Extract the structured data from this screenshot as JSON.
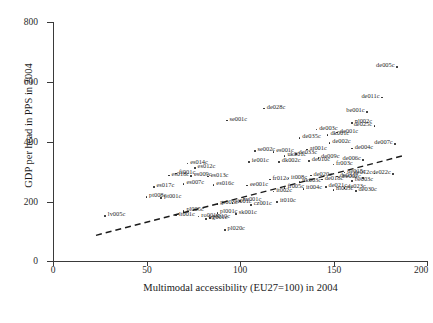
{
  "chart_data": {
    "type": "scatter",
    "title": "",
    "xlabel": "Multimodal accessibility (EU27=100) in 2004",
    "ylabel": "GDP per head in PPS in 2004",
    "xlim": [
      0,
      200
    ],
    "ylim": [
      0,
      800
    ],
    "xticks": [
      0,
      50,
      100,
      150,
      200
    ],
    "yticks": [
      0,
      200,
      400,
      600,
      800
    ],
    "grid": false,
    "legend": "none",
    "marker": "small-dot",
    "trendline": {
      "type": "linear-dashed",
      "x_start": 23,
      "y_start": 86,
      "x_end": 187,
      "y_end": 352
    },
    "points": [
      {
        "label": "de005c",
        "x": 184,
        "y": 648
      },
      {
        "label": "de011c",
        "x": 176,
        "y": 546
      },
      {
        "label": "be001c",
        "x": 168,
        "y": 498
      },
      {
        "label": "de028c",
        "x": 113,
        "y": 510
      },
      {
        "label": "nl002c",
        "x": 160,
        "y": 462
      },
      {
        "label": "de025c",
        "x": 172,
        "y": 452
      },
      {
        "label": "se001c",
        "x": 93,
        "y": 470
      },
      {
        "label": "de003c",
        "x": 141,
        "y": 440
      },
      {
        "label": "dk001c",
        "x": 147,
        "y": 422
      },
      {
        "label": "de035c",
        "x": 132,
        "y": 412
      },
      {
        "label": "de001c",
        "x": 152,
        "y": 430
      },
      {
        "label": "de002c",
        "x": 148,
        "y": 394
      },
      {
        "label": "de007c",
        "x": 183,
        "y": 390
      },
      {
        "label": "de004c",
        "x": 160,
        "y": 376
      },
      {
        "label": "at001c",
        "x": 136,
        "y": 372
      },
      {
        "label": "se002c",
        "x": 108,
        "y": 368
      },
      {
        "label": "es001c",
        "x": 118,
        "y": 364
      },
      {
        "label": "de033c",
        "x": 130,
        "y": 358
      },
      {
        "label": "uk001c",
        "x": 124,
        "y": 350
      },
      {
        "label": "de009c",
        "x": 142,
        "y": 344
      },
      {
        "label": "de006c",
        "x": 166,
        "y": 338
      },
      {
        "label": "de010c",
        "x": 137,
        "y": 334
      },
      {
        "label": "dk002c",
        "x": 121,
        "y": 330
      },
      {
        "label": "ie001c",
        "x": 105,
        "y": 330
      },
      {
        "label": "fr003c",
        "x": 150,
        "y": 322
      },
      {
        "label": "es014c",
        "x": 72,
        "y": 326
      },
      {
        "label": "es012c",
        "x": 76,
        "y": 310
      },
      {
        "label": "de015c",
        "x": 156,
        "y": 296
      },
      {
        "label": "de012c",
        "x": 172,
        "y": 292
      },
      {
        "label": "de022c",
        "x": 182,
        "y": 290
      },
      {
        "label": "be002c",
        "x": 166,
        "y": 278
      },
      {
        "label": "fi001c",
        "x": 66,
        "y": 292
      },
      {
        "label": "es018c",
        "x": 62,
        "y": 286
      },
      {
        "label": "es009c",
        "x": 74,
        "y": 284
      },
      {
        "label": "es013c",
        "x": 83,
        "y": 282
      },
      {
        "label": "de020c",
        "x": 138,
        "y": 286
      },
      {
        "label": "de031c",
        "x": 152,
        "y": 282
      },
      {
        "label": "it008c",
        "x": 126,
        "y": 276
      },
      {
        "label": "fr012c",
        "x": 116,
        "y": 272
      },
      {
        "label": "de018c",
        "x": 144,
        "y": 272
      },
      {
        "label": "be003c",
        "x": 160,
        "y": 268
      },
      {
        "label": "uk003c",
        "x": 132,
        "y": 264
      },
      {
        "label": "es007c",
        "x": 70,
        "y": 258
      },
      {
        "label": "es016c",
        "x": 86,
        "y": 254
      },
      {
        "label": "ee001c",
        "x": 104,
        "y": 252
      },
      {
        "label": "es017c",
        "x": 54,
        "y": 248
      },
      {
        "label": "de021c",
        "x": 146,
        "y": 248
      },
      {
        "label": "de023c",
        "x": 156,
        "y": 244
      },
      {
        "label": "fr005c",
        "x": 124,
        "y": 244
      },
      {
        "label": "it004c",
        "x": 134,
        "y": 240
      },
      {
        "label": "nl005c",
        "x": 150,
        "y": 236
      },
      {
        "label": "de030c",
        "x": 162,
        "y": 234
      },
      {
        "label": "it002c",
        "x": 118,
        "y": 232
      },
      {
        "label": "pt008c",
        "x": 50,
        "y": 214
      },
      {
        "label": "pt001c",
        "x": 58,
        "y": 210
      },
      {
        "label": "hu001c",
        "x": 100,
        "y": 200
      },
      {
        "label": "it010c",
        "x": 120,
        "y": 196
      },
      {
        "label": "si001c",
        "x": 96,
        "y": 194
      },
      {
        "label": "gr003c",
        "x": 88,
        "y": 190
      },
      {
        "label": "lv005c",
        "x": 28,
        "y": 150
      },
      {
        "label": "cz001c",
        "x": 106,
        "y": 186
      },
      {
        "label": "pl005c",
        "x": 70,
        "y": 166
      },
      {
        "label": "pl001c",
        "x": 88,
        "y": 160
      },
      {
        "label": "sk001c",
        "x": 98,
        "y": 156
      },
      {
        "label": "ro001c",
        "x": 78,
        "y": 148
      },
      {
        "label": "bg001c",
        "x": 82,
        "y": 140
      },
      {
        "label": "pl020c",
        "x": 92,
        "y": 104
      },
      {
        "label": "lt001c",
        "x": 66,
        "y": 152
      },
      {
        "label": "pl010c",
        "x": 84,
        "y": 144
      }
    ],
    "cluster_note": "dense overlapping label cluster in lower-central region"
  },
  "axes": {
    "y_title": "GDP per head in PPS in 2004",
    "x_title": "Multimodal accessibility (EU27=100) in 2004",
    "y_tick_labels": [
      "0",
      "200",
      "400",
      "600",
      "800"
    ],
    "x_tick_labels": [
      "0",
      "50",
      "100",
      "150",
      "200"
    ]
  },
  "colors": {
    "axis": "#3a3a3a",
    "marker": "#202020",
    "label_text": "#1f1f1f",
    "trendline": "#1a1a1a",
    "background": "#ffffff"
  }
}
